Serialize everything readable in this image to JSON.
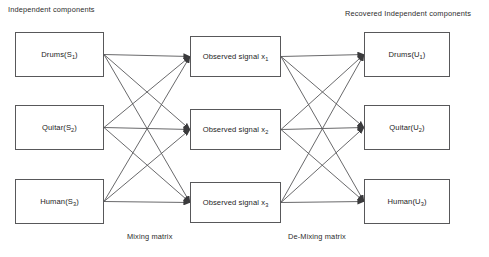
{
  "diagram": {
    "title_left": "Independent components",
    "title_right": "Recovered Independent components",
    "caption_mixing": "Mixing matrix",
    "caption_demixing": "De-Mixing matrix",
    "line_color": "#58585a",
    "text_color": "#1d1d1d",
    "background": "#ffffff"
  },
  "sources": [
    {
      "label": "Drums(S",
      "sub": "1",
      "tail": ")",
      "full": "Drums(S1)"
    },
    {
      "label": "Quitar(S",
      "sub": "2",
      "tail": ")",
      "full": "Quitar(S2)"
    },
    {
      "label": "Human(S",
      "sub": "3",
      "tail": ")",
      "full": "Human(S3)"
    }
  ],
  "observed": [
    {
      "label": "Observed signal x",
      "sub": "1",
      "tail": "",
      "full": "Observed signal x1"
    },
    {
      "label": "Observed signal x",
      "sub": "2",
      "tail": "",
      "full": "Observed signal x2"
    },
    {
      "label": "Observed signal x",
      "sub": "3",
      "tail": "",
      "full": "Observed signal x3"
    }
  ],
  "recovered": [
    {
      "label": "Drums(U",
      "sub": "1",
      "tail": ")",
      "full": "Drums(U1)"
    },
    {
      "label": "Quitar(U",
      "sub": "2",
      "tail": ")",
      "full": "Quitar(U2)"
    },
    {
      "label": "Human(U",
      "sub": "3",
      "tail": ")",
      "full": "Human(U3)"
    }
  ],
  "edges": {
    "mixing": [
      [
        0,
        0
      ],
      [
        0,
        1
      ],
      [
        0,
        2
      ],
      [
        1,
        0
      ],
      [
        1,
        1
      ],
      [
        1,
        2
      ],
      [
        2,
        0
      ],
      [
        2,
        1
      ],
      [
        2,
        2
      ]
    ],
    "demixing": [
      [
        0,
        0
      ],
      [
        0,
        1
      ],
      [
        0,
        2
      ],
      [
        1,
        0
      ],
      [
        1,
        1
      ],
      [
        1,
        2
      ],
      [
        2,
        0
      ],
      [
        2,
        1
      ],
      [
        2,
        2
      ]
    ]
  }
}
